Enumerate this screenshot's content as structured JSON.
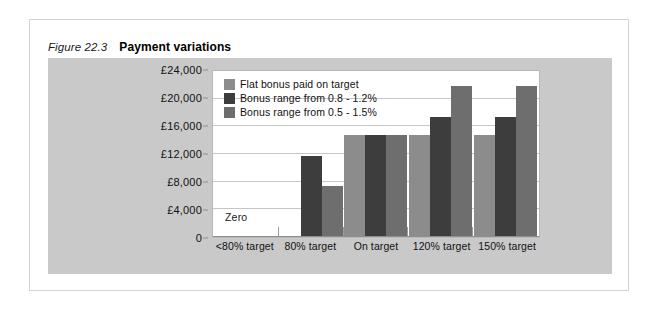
{
  "figure": {
    "label": "Figure 22.3",
    "title": "Payment variations"
  },
  "colors": {
    "panel_background": "#c9c9c9",
    "plot_background": "#ffffff",
    "gridline": "#c6c6c6",
    "series_flat": "#8c8c8c",
    "series_narrow": "#3d3d3d",
    "series_wide": "#6e6e6e"
  },
  "annotations": {
    "zero": "Zero"
  },
  "chart_data": {
    "type": "bar",
    "title": "Payment variations",
    "xlabel": "",
    "ylabel": "",
    "ylim": [
      0,
      24000
    ],
    "ytick_values": [
      0,
      4000,
      8000,
      12000,
      16000,
      20000,
      24000
    ],
    "ytick_labels": [
      "0",
      "£4,000",
      "£8,000",
      "£12,000",
      "£16,000",
      "£20,000",
      "£24,000"
    ],
    "grid": true,
    "legend_position": "top-left-inside",
    "categories": [
      "<80% target",
      "80% target",
      "On target",
      "120% target",
      "150% target"
    ],
    "series": [
      {
        "name": "Flat bonus paid on target",
        "color": "#8c8c8c",
        "values": [
          0,
          0,
          14800,
          14800,
          14800
        ]
      },
      {
        "name": "Bonus range from 0.8 - 1.2%",
        "color": "#3d3d3d",
        "values": [
          0,
          11700,
          14800,
          17400,
          17400
        ]
      },
      {
        "name": "Bonus range from 0.5 - 1.5%",
        "color": "#6e6e6e",
        "values": [
          0,
          7300,
          14800,
          21900,
          21900
        ]
      }
    ]
  }
}
